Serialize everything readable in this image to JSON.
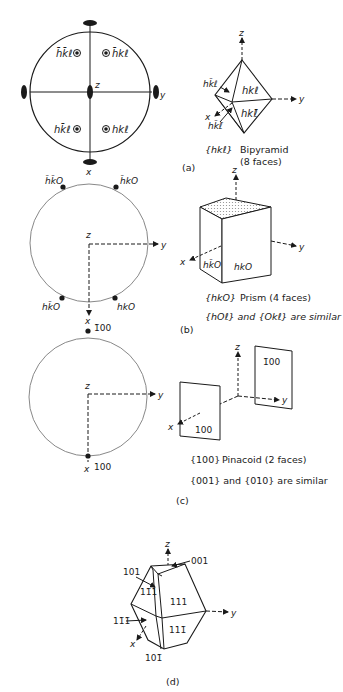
{
  "panels": {
    "a": {
      "tag": "(a)",
      "stereogram": {
        "axis_z": "z",
        "axis_y": "y",
        "axis_x": "x",
        "poles": [
          "h̄k̄ℓ",
          "h̄kℓ",
          "hk̄ℓ",
          "hkℓ"
        ]
      },
      "solid": {
        "axis_z": "z",
        "axis_y": "y",
        "axis_x": "x",
        "faces": [
          "hk̄ℓ",
          "hkℓ",
          "hkℓ̄",
          "hk̄ℓ̄"
        ]
      },
      "caption": {
        "form": "{hkℓ}",
        "name": "Bipyramid",
        "faces": "(8 faces)"
      }
    },
    "b": {
      "tag": "(b)",
      "stereogram": {
        "axis_z": "z",
        "axis_y": "y",
        "axis_x": "x",
        "poles": [
          "h̄k̄O",
          "h̄kO",
          "hk̄O",
          "hkO"
        ]
      },
      "solid": {
        "axis_z": "z",
        "axis_y": "y",
        "axis_x": "x",
        "faces": [
          "hk̄O",
          "hkO"
        ]
      },
      "caption": {
        "form": "{hkO}",
        "name": "Prism (4 faces)",
        "similar": "{hOℓ} and {Okℓ} are similar"
      }
    },
    "c": {
      "tag": "(c)",
      "stereogram": {
        "axis_z": "z",
        "axis_y": "y",
        "axis_x": "x",
        "poles": [
          "1̄00",
          "100"
        ]
      },
      "solid": {
        "axis_z": "z",
        "axis_y": "y",
        "axis_x": "x",
        "faces": [
          "1̄00",
          "100"
        ]
      },
      "caption": {
        "form": "{100}",
        "name": "Pinacoid  (2 faces)",
        "similar": "{001} and {010} are similar"
      }
    },
    "d": {
      "tag": "(d)",
      "solid": {
        "axis_z": "z",
        "axis_y": "y",
        "axis_x": "x",
        "faces": [
          "001",
          "101",
          "11̄1",
          "111",
          "11̄1̄",
          "111̄",
          "101̄"
        ]
      }
    }
  },
  "colors": {
    "ink": "#1a1a1a",
    "paper": "#ffffff",
    "hatch": "#9a9a9a"
  }
}
